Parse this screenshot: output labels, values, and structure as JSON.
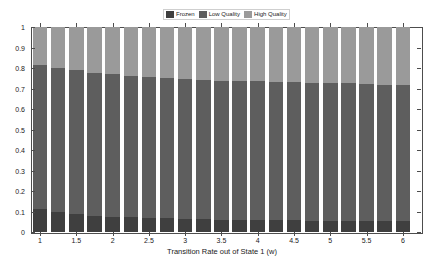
{
  "chart_data": {
    "type": "bar",
    "subtype": "stacked-bar-100-percent",
    "title": "",
    "xlabel": "Transition Rate out of State 1 (w)",
    "ylabel": "",
    "xlim": [
      0.875,
      6.25
    ],
    "ylim": [
      0,
      1
    ],
    "grid": false,
    "legend_position": "top-center",
    "categories": [
      1,
      1.25,
      1.5,
      1.75,
      2,
      2.25,
      2.5,
      2.75,
      3,
      3.25,
      3.5,
      3.75,
      4,
      4.25,
      4.5,
      4.75,
      5,
      5.25,
      5.5,
      5.75,
      6
    ],
    "xtick_labels": [
      "1",
      "1.5",
      "2",
      "2.5",
      "3",
      "3.5",
      "4",
      "4.5",
      "5",
      "5.5",
      "6"
    ],
    "xtick_values": [
      1,
      1.5,
      2,
      2.5,
      3,
      3.5,
      4,
      4.5,
      5,
      5.5,
      6
    ],
    "ytick_labels": [
      "0",
      "0.1",
      "0.2",
      "0.3",
      "0.4",
      "0.5",
      "0.6",
      "0.7",
      "0.8",
      "0.9",
      "1"
    ],
    "ytick_values": [
      0,
      0.1,
      0.2,
      0.3,
      0.4,
      0.5,
      0.6,
      0.7,
      0.8,
      0.9,
      1
    ],
    "series": [
      {
        "name": "Frozen",
        "color": "#3f3f3f",
        "values": [
          0.112,
          0.097,
          0.088,
          0.08,
          0.074,
          0.071,
          0.068,
          0.066,
          0.064,
          0.062,
          0.061,
          0.06,
          0.059,
          0.058,
          0.057,
          0.056,
          0.056,
          0.055,
          0.055,
          0.054,
          0.054
        ]
      },
      {
        "name": "Low Quality",
        "color": "#5e5e5e",
        "values": [
          0.703,
          0.705,
          0.7,
          0.694,
          0.695,
          0.691,
          0.687,
          0.685,
          0.682,
          0.68,
          0.678,
          0.676,
          0.676,
          0.675,
          0.673,
          0.671,
          0.67,
          0.67,
          0.667,
          0.665,
          0.661
        ]
      },
      {
        "name": "High Quality",
        "color": "#9a9a9a",
        "values": [
          0.185,
          0.198,
          0.212,
          0.226,
          0.231,
          0.238,
          0.245,
          0.249,
          0.254,
          0.258,
          0.261,
          0.264,
          0.265,
          0.267,
          0.27,
          0.273,
          0.274,
          0.275,
          0.278,
          0.281,
          0.285
        ]
      }
    ],
    "cumulative_tops": {
      "frozen_low_boundary": [
        0.112,
        0.097,
        0.088,
        0.08,
        0.074,
        0.071,
        0.068,
        0.066,
        0.064,
        0.062,
        0.061,
        0.06,
        0.059,
        0.058,
        0.057,
        0.056,
        0.056,
        0.055,
        0.055,
        0.054,
        0.054
      ],
      "low_high_boundary": [
        0.815,
        0.802,
        0.788,
        0.774,
        0.769,
        0.762,
        0.755,
        0.751,
        0.746,
        0.742,
        0.739,
        0.736,
        0.735,
        0.733,
        0.73,
        0.727,
        0.726,
        0.725,
        0.722,
        0.719,
        0.715
      ]
    }
  },
  "legend": {
    "items": [
      {
        "label": "Frozen",
        "color": "#3f3f3f"
      },
      {
        "label": "Low Quality",
        "color": "#5e5e5e"
      },
      {
        "label": "High Quality",
        "color": "#9a9a9a"
      }
    ]
  },
  "axes": {
    "x_axis_label": "Transition Rate out of State 1 (w)"
  },
  "colors": {
    "frozen": "#3f3f3f",
    "low_quality": "#5e5e5e",
    "high_quality": "#9a9a9a",
    "axis": "#4d4d4d",
    "text": "#1a1a1a",
    "background": "#ffffff"
  }
}
